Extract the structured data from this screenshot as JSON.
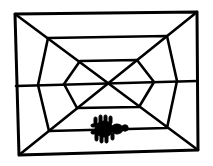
{
  "figure": {
    "colors": {
      "line": "#000000",
      "background": "#ffffff",
      "spider": "#000000"
    },
    "outer_frame": {
      "tl": [
        15,
        14
      ],
      "tr": [
        197,
        12
      ],
      "br": [
        198,
        150
      ],
      "bl": [
        19,
        155
      ]
    },
    "middle_ring": {
      "tl": [
        48,
        38
      ],
      "tr": [
        167,
        36
      ],
      "r": [
        177,
        80
      ],
      "br": [
        167,
        128
      ],
      "bl": [
        49,
        131
      ],
      "l": [
        38,
        85
      ]
    },
    "inner_ring": {
      "tl": [
        80,
        61
      ],
      "tr": [
        137,
        60
      ],
      "r": [
        154,
        82
      ],
      "br": [
        139,
        107
      ],
      "bl": [
        77,
        108
      ],
      "l": [
        64,
        84
      ]
    },
    "horizontal_thread_y": 84,
    "spider": {
      "center": [
        108,
        128
      ]
    }
  }
}
